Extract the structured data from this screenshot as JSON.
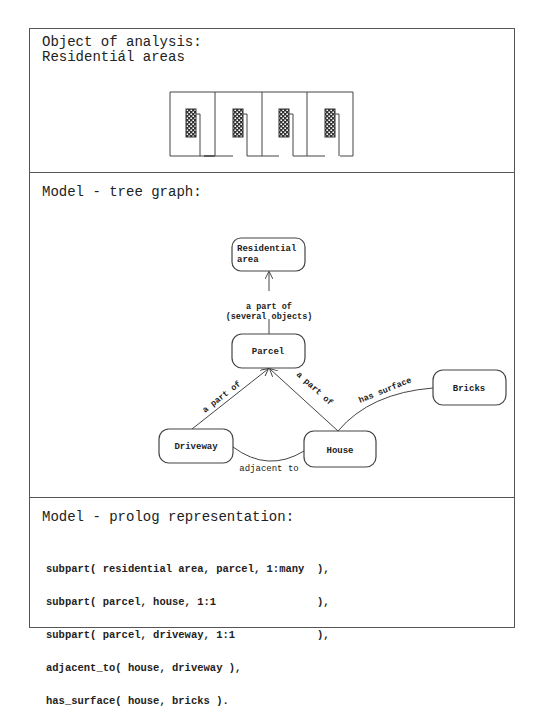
{
  "sections": {
    "object": {
      "heading_line1": "Object of analysis:",
      "heading_line2": "Residentiál areas",
      "illustration": {
        "parcel_count": 4,
        "house_fill": "#333333"
      }
    },
    "tree": {
      "heading": "Model - tree graph:",
      "nodes": [
        {
          "id": "residential_area",
          "label_line1": "Residential",
          "label_line2": "area"
        },
        {
          "id": "parcel",
          "label": "Parcel"
        },
        {
          "id": "driveway",
          "label": "Driveway"
        },
        {
          "id": "house",
          "label": "House"
        },
        {
          "id": "bricks",
          "label": "Bricks"
        }
      ],
      "edges": [
        {
          "from": "parcel",
          "to": "residential_area",
          "label_line1": "a part of",
          "label_line2": "(several objects)"
        },
        {
          "from": "driveway",
          "to": "parcel",
          "label": "a part of"
        },
        {
          "from": "house",
          "to": "parcel",
          "label": "a part of"
        },
        {
          "from": "house",
          "to": "bricks",
          "label": "has surface"
        },
        {
          "from": "driveway",
          "to": "house",
          "label": "adjacent to"
        }
      ]
    },
    "prolog": {
      "heading": "Model - prolog representation:",
      "lines": [
        "subpart( residential area, parcel, 1:many  ),",
        "subpart( parcel, house, 1:1                ),",
        "subpart( parcel, driveway, 1:1             ),",
        "adjacent_to( house, driveway ),",
        "has_surface( house, bricks )."
      ]
    }
  },
  "colors": {
    "line": "#444444",
    "text": "#222222",
    "background": "#ffffff"
  }
}
